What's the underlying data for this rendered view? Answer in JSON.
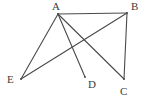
{
  "figure": {
    "type": "geometry-line-diagram",
    "width": 148,
    "height": 101,
    "background_color": "#ffffff",
    "stroke_color": "#4a4a4a",
    "stroke_width": 1.1,
    "label_color": "#3c3c3c",
    "vertices": [
      {
        "id": "A",
        "label": "A",
        "x": 58,
        "y": 14,
        "label_x": 52,
        "label_y": 1
      },
      {
        "id": "B",
        "label": "B",
        "x": 127,
        "y": 13,
        "label_x": 131,
        "label_y": 1
      },
      {
        "id": "C",
        "label": "C",
        "x": 124,
        "y": 79,
        "label_x": 120,
        "label_y": 86
      },
      {
        "id": "D",
        "label": "D",
        "x": 85,
        "y": 77,
        "label_x": 88,
        "label_y": 79
      },
      {
        "id": "E",
        "label": "E",
        "x": 21,
        "y": 79,
        "label_x": 7,
        "label_y": 74
      }
    ],
    "edges": [
      {
        "id": "AB",
        "from": "A",
        "to": "B"
      },
      {
        "id": "AE",
        "from": "A",
        "to": "E"
      },
      {
        "id": "AD",
        "from": "A",
        "to": "D"
      },
      {
        "id": "AC",
        "from": "A",
        "to": "C"
      },
      {
        "id": "BE",
        "from": "B",
        "to": "E"
      },
      {
        "id": "BC",
        "from": "B",
        "to": "C"
      }
    ]
  }
}
